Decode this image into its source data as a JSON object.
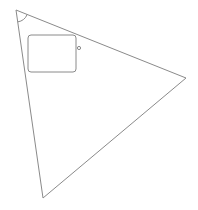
{
  "canvas": {
    "width": 198,
    "height": 210,
    "background": "#ffffff"
  },
  "style": {
    "stroke": "#8a8a8a",
    "stroke_width": 1
  },
  "triangle": {
    "vertices": [
      {
        "x": 16,
        "y": 10
      },
      {
        "x": 186,
        "y": 78
      },
      {
        "x": 43,
        "y": 198
      }
    ]
  },
  "angle_arc": {
    "vertex": {
      "x": 16,
      "y": 10
    },
    "radius": 12
  },
  "rectangle": {
    "x": 28,
    "y": 35,
    "width": 48,
    "height": 37,
    "corner_radius": 3
  },
  "point": {
    "cx": 79,
    "cy": 48,
    "r": 1.6
  }
}
